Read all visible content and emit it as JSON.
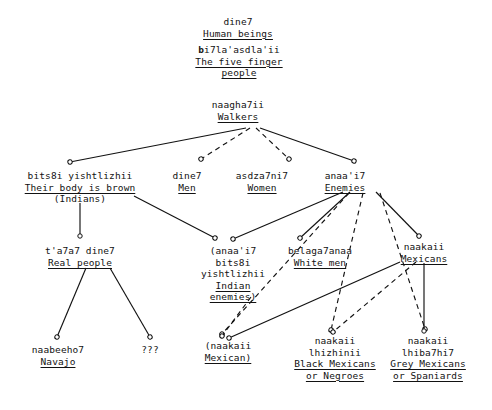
{
  "diagram": {
    "style": {
      "line_color": "#121212",
      "background": "#ffffff",
      "solid_edge": "solid",
      "dashed_edge": "dashed",
      "arrowhead": "open-circle-with-barbs"
    },
    "nodes": [
      {
        "id": "dine7_human",
        "native": "dine7",
        "gloss": "Human beings",
        "gloss_underlined": true,
        "x": 214,
        "y": 16
      },
      {
        "id": "bi7laasdlaii",
        "native": "bi7la'asdla'ii",
        "native_bold_prefix": "b",
        "gloss_line1": "The five finger",
        "gloss_line2": "people",
        "gloss_underlined": true,
        "x": 189,
        "y": 44
      },
      {
        "id": "naagha7ii",
        "native": "naagha7ii",
        "gloss": "Walkers",
        "gloss_underlined": true,
        "x": 203,
        "y": 99
      },
      {
        "id": "bits8i_yishtlizhii",
        "native": "bits8i yishtlizhii",
        "gloss": "Their body is brown",
        "gloss_underlined": true,
        "paren": "(Indians)",
        "x": 33,
        "y": 170
      },
      {
        "id": "dine7_men",
        "native": "dine7",
        "gloss": "Men",
        "gloss_underlined": true,
        "x": 186,
        "y": 170
      },
      {
        "id": "asdza7ni7",
        "native": "asdza7ni7",
        "gloss": "Women",
        "gloss_underlined": true,
        "x": 255,
        "y": 170
      },
      {
        "id": "anaa17",
        "native": "anaa'i7",
        "gloss": "Enemies",
        "gloss_underlined": true,
        "x": 337,
        "y": 170
      },
      {
        "id": "ta7a7_dine7",
        "native": "t'a7a7 dine7",
        "gloss": "Real people",
        "gloss_underlined": true,
        "x": 55,
        "y": 245
      },
      {
        "id": "indian_enemies",
        "native_line1": "(anaa'i7",
        "native_line2": "bits8i",
        "native_line3": "yishtlizhii",
        "gloss_line1": "Indian",
        "gloss_line2": "enemies)",
        "gloss_underlined": true,
        "x": 192,
        "y": 245
      },
      {
        "id": "belaga7anaa",
        "native": "belaga7anaa",
        "gloss": "White men",
        "gloss_underlined": true,
        "x": 283,
        "y": 245
      },
      {
        "id": "naakaii_mexicans",
        "native": "naakaii",
        "gloss": "Mexicans",
        "gloss_underlined": true,
        "x": 397,
        "y": 241
      },
      {
        "id": "naabeeho7",
        "native": "naabeeho7",
        "gloss": "Navajo",
        "gloss_underlined": true,
        "x": 24,
        "y": 344
      },
      {
        "id": "unknown",
        "native": "???",
        "x": 143,
        "y": 344
      },
      {
        "id": "naakaii_mexican",
        "native": "(naakaii",
        "gloss": "Mexican)",
        "gloss_underlined": true,
        "x": 197,
        "y": 340
      },
      {
        "id": "naakaii_lhizhinii",
        "native_line1": "naakaii",
        "native_line2": "lhizhinii",
        "gloss_line1": "Black Mexicans",
        "gloss_line2": "or Negroes",
        "gloss_underlined": true,
        "x": 290,
        "y": 335
      },
      {
        "id": "naakaii_lhiba7hi7",
        "native_line1": "naakaii",
        "native_line2": "lhiba7hi7",
        "gloss_line1": "Grey Mexicans",
        "gloss_line2": "or Spaniards",
        "gloss_underlined": true,
        "x": 383,
        "y": 335
      }
    ],
    "edges": [
      {
        "from": "naagha7ii",
        "to": "bits8i_yishtlizhii",
        "style": "solid"
      },
      {
        "from": "naagha7ii",
        "to": "dine7_men",
        "style": "dashed"
      },
      {
        "from": "naagha7ii",
        "to": "asdza7ni7",
        "style": "dashed"
      },
      {
        "from": "naagha7ii",
        "to": "anaa17",
        "style": "solid"
      },
      {
        "from": "bits8i_yishtlizhii",
        "to": "ta7a7_dine7",
        "style": "solid"
      },
      {
        "from": "bits8i_yishtlizhii",
        "to": "indian_enemies",
        "style": "solid"
      },
      {
        "from": "anaa17",
        "to": "indian_enemies",
        "style": "solid"
      },
      {
        "from": "anaa17",
        "to": "belaga7anaa",
        "style": "solid"
      },
      {
        "from": "anaa17",
        "to": "naakaii_mexicans",
        "style": "solid"
      },
      {
        "from": "anaa17",
        "to": "naakaii_mexican",
        "style": "dashed"
      },
      {
        "from": "anaa17",
        "to": "naakaii_lhizhinii",
        "style": "dashed"
      },
      {
        "from": "anaa17",
        "to": "naakaii_lhiba7hi7",
        "style": "dashed"
      },
      {
        "from": "ta7a7_dine7",
        "to": "naabeeho7",
        "style": "solid"
      },
      {
        "from": "ta7a7_dine7",
        "to": "unknown",
        "style": "solid"
      },
      {
        "from": "indian_enemies",
        "to": "naakaii_mexican",
        "style": "dashed"
      },
      {
        "from": "naakaii_mexicans",
        "to": "naakaii_mexican",
        "style": "solid"
      },
      {
        "from": "naakaii_mexicans",
        "to": "naakaii_lhizhinii",
        "style": "solid"
      },
      {
        "from": "naakaii_mexicans",
        "to": "naakaii_lhiba7hi7",
        "style": "solid"
      }
    ]
  }
}
